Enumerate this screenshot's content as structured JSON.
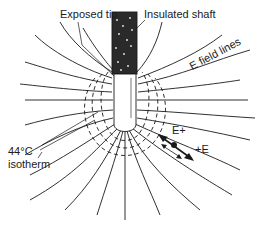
{
  "diagram": {
    "labels": {
      "exposed_tip": "Exposed tip",
      "insulated_shaft": "Insulated shaft",
      "e_field_lines": "E field lines",
      "isotherm_temp": "44°C",
      "isotherm_word": "isotherm",
      "e_plus": "E+",
      "plus_e": "+E"
    },
    "colors": {
      "line": "#1a1a1a",
      "shaft_fill": "#2a2a2a",
      "tip_fill": "#ffffff",
      "background": "#ffffff"
    },
    "components": [
      "insulated shaft",
      "exposed tip",
      "E field lines",
      "44°C isotherm (dashed)",
      "oscillating charge arrows"
    ]
  }
}
